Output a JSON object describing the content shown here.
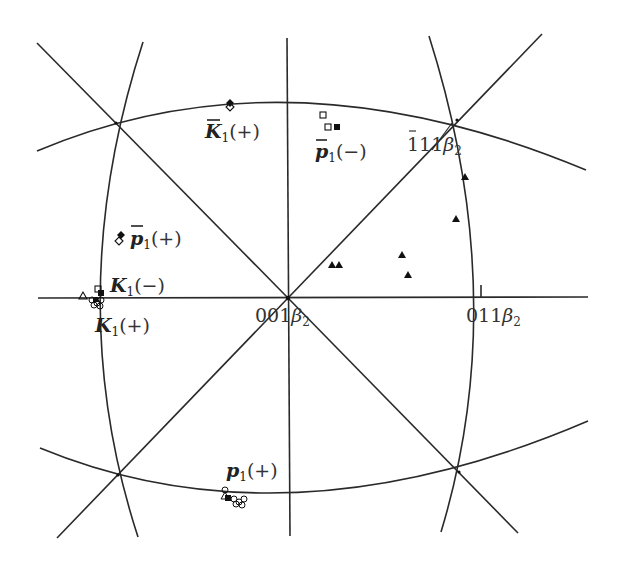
{
  "diagram": {
    "type": "stereographic-projection",
    "poles": {
      "center": {
        "index": "001",
        "phase": "β",
        "phase_sub": "2"
      },
      "right": {
        "index": "011",
        "phase": "β",
        "phase_sub": "2"
      },
      "upper_right": {
        "index_bar": "1",
        "index_rest": "11",
        "phase": "β",
        "phase_sub": "2"
      }
    },
    "labels": {
      "kbar1_plus": {
        "sym": "K",
        "sub": "1",
        "sign": "(+)",
        "overbar": true
      },
      "pbar1_minus": {
        "sym": "p",
        "sub": "1",
        "sign": "(−)",
        "overbar": true
      },
      "pbar1_plus": {
        "sym": "p",
        "sub": "1",
        "sign": "(+)",
        "overbar": true
      },
      "k1_minus": {
        "sym": "K",
        "sub": "1",
        "sign": "(−)",
        "overbar": false
      },
      "k1_plus": {
        "sym": "K",
        "sub": "1",
        "sign": "(+)",
        "overbar": false
      },
      "p1_plus": {
        "sym": "p",
        "sub": "1",
        "sign": "(+)",
        "overbar": false
      }
    },
    "marker_legend": {
      "filled_triangle": "data points (triangle)",
      "filled_diamond": "variant pole (filled)",
      "open_diamond": "variant pole (open)",
      "filled_square": "variant pole (filled)",
      "open_square": "variant pole (open)",
      "open_circle": "variant pole (open)",
      "open_triangle": "variant pole (open)"
    },
    "triangles": [
      [
        332,
        265
      ],
      [
        339,
        265
      ],
      [
        402,
        255
      ],
      [
        408,
        275
      ],
      [
        456,
        219
      ],
      [
        465,
        177
      ]
    ],
    "colors": {
      "line": "#2a2a2a",
      "marker": "#111111",
      "text": "#333333"
    }
  }
}
